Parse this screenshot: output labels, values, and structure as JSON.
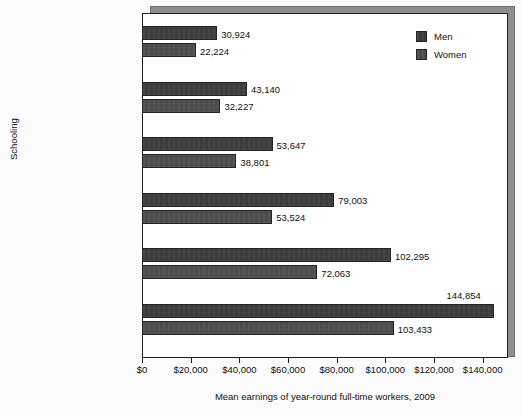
{
  "chart_data": {
    "type": "bar",
    "orientation": "horizontal",
    "title": "",
    "xlabel": "Mean earnings of year-round full-time workers, 2009",
    "ylabel": "Schooling",
    "xlim": [
      0,
      150000
    ],
    "grid": false,
    "legend_position": "top-right",
    "categories": [
      "Less than high school",
      "High school",
      "Some college",
      "Bachelor's degree",
      "Master's degree",
      "Doctoral degree"
    ],
    "series": [
      {
        "name": "Men",
        "color": "#3b3b3b",
        "values": [
          30924,
          43140,
          53647,
          79003,
          102295,
          144854
        ],
        "labels": [
          "30,924",
          "43,140",
          "53,647",
          "79,003",
          "102,295",
          "144,854"
        ]
      },
      {
        "name": "Women",
        "color": "#4b4b4b",
        "values": [
          22224,
          32227,
          38801,
          53524,
          72063,
          103433
        ],
        "labels": [
          "22,224",
          "32,227",
          "38,801",
          "53,524",
          "72,063",
          "103,433"
        ]
      }
    ],
    "xticks": [
      0,
      20000,
      40000,
      60000,
      80000,
      100000,
      120000,
      140000
    ],
    "xtick_labels": [
      "$0",
      "$20,000",
      "$40,000",
      "$60,000",
      "$80,000",
      "$100,000",
      "$120,000",
      "$140,000"
    ]
  }
}
